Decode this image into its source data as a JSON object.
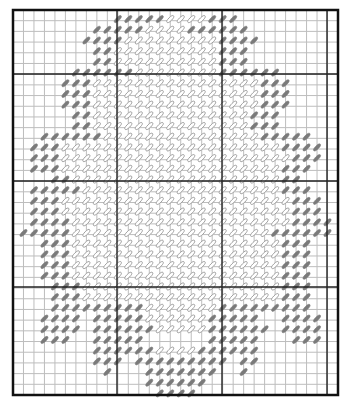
{
  "chart": {
    "type": "needlepoint-stitch-chart",
    "grid": {
      "left": 13,
      "top": 10,
      "right": 338,
      "bottom": 395,
      "cols": 31,
      "rows": 36,
      "major_v": [
        117,
        222,
        327
      ],
      "major_h": [
        74,
        181,
        287
      ],
      "colors": {
        "minor": "#bdbdbd",
        "major": "#222222",
        "border": "#111111",
        "background": "#ffffff"
      }
    },
    "stitch_colors": {
      "dark": "#7a7a7a",
      "light_fill": "#ffffff",
      "light_stroke": "#9a9a9a"
    },
    "legend": "dark = border stitches (gray), light = fill stitches (outlined)",
    "rows": [
      {
        "r": 1,
        "from": 10,
        "to": 21,
        "dark": [
          [
            10,
            14
          ],
          [
            19,
            21
          ]
        ]
      },
      {
        "r": 2,
        "from": 8,
        "to": 22,
        "dark": [
          [
            8,
            12
          ],
          [
            17,
            22
          ]
        ]
      },
      {
        "r": 3,
        "from": 7,
        "to": 23,
        "dark": [
          [
            7,
            10
          ],
          [
            20,
            23
          ]
        ]
      },
      {
        "r": 4,
        "from": 8,
        "to": 22,
        "dark": [
          [
            8,
            9
          ],
          [
            20,
            22
          ]
        ]
      },
      {
        "r": 5,
        "from": 8,
        "to": 22,
        "dark": [
          [
            8,
            9
          ],
          [
            20,
            22
          ]
        ]
      },
      {
        "r": 6,
        "from": 6,
        "to": 25,
        "dark": [
          [
            6,
            11
          ],
          [
            20,
            25
          ]
        ]
      },
      {
        "r": 7,
        "from": 5,
        "to": 26,
        "dark": [
          [
            5,
            7
          ],
          [
            24,
            26
          ]
        ]
      },
      {
        "r": 8,
        "from": 5,
        "to": 26,
        "dark": [
          [
            5,
            7
          ],
          [
            24,
            26
          ]
        ]
      },
      {
        "r": 9,
        "from": 5,
        "to": 26,
        "dark": [
          [
            5,
            7
          ],
          [
            24,
            26
          ]
        ]
      },
      {
        "r": 10,
        "from": 6,
        "to": 25,
        "dark": [
          [
            6,
            7
          ],
          [
            23,
            25
          ]
        ]
      },
      {
        "r": 11,
        "from": 6,
        "to": 25,
        "dark": [
          [
            6,
            7
          ],
          [
            23,
            25
          ]
        ]
      },
      {
        "r": 12,
        "from": 3,
        "to": 28,
        "dark": [
          [
            3,
            8
          ],
          [
            24,
            28
          ]
        ]
      },
      {
        "r": 13,
        "from": 2,
        "to": 29,
        "dark": [
          [
            2,
            4
          ],
          [
            26,
            29
          ]
        ]
      },
      {
        "r": 14,
        "from": 2,
        "to": 29,
        "dark": [
          [
            2,
            4
          ],
          [
            27,
            29
          ]
        ]
      },
      {
        "r": 15,
        "from": 2,
        "to": 28,
        "dark": [
          [
            2,
            4
          ],
          [
            26,
            28
          ]
        ]
      },
      {
        "r": 16,
        "from": 4,
        "to": 27,
        "dark": [
          [
            4,
            5
          ],
          [
            26,
            27
          ]
        ]
      },
      {
        "r": 17,
        "from": 2,
        "to": 28,
        "dark": [
          [
            2,
            6
          ],
          [
            26,
            28
          ]
        ]
      },
      {
        "r": 18,
        "from": 2,
        "to": 29,
        "dark": [
          [
            2,
            4
          ],
          [
            27,
            29
          ]
        ]
      },
      {
        "r": 19,
        "from": 2,
        "to": 29,
        "dark": [
          [
            2,
            4
          ],
          [
            27,
            29
          ]
        ]
      },
      {
        "r": 20,
        "from": 2,
        "to": 30,
        "dark": [
          [
            2,
            5
          ],
          [
            27,
            30
          ]
        ]
      },
      {
        "r": 21,
        "from": 1,
        "to": 30,
        "dark": [
          [
            1,
            5
          ],
          [
            25,
            30
          ]
        ]
      },
      {
        "r": 22,
        "from": 3,
        "to": 28,
        "dark": [
          [
            3,
            5
          ],
          [
            26,
            28
          ]
        ]
      },
      {
        "r": 23,
        "from": 3,
        "to": 28,
        "dark": [
          [
            3,
            5
          ],
          [
            26,
            28
          ]
        ]
      },
      {
        "r": 24,
        "from": 3,
        "to": 28,
        "dark": [
          [
            3,
            5
          ],
          [
            26,
            28
          ]
        ]
      },
      {
        "r": 25,
        "from": 3,
        "to": 28,
        "dark": [
          [
            3,
            5
          ],
          [
            26,
            28
          ]
        ]
      },
      {
        "r": 26,
        "from": 4,
        "to": 28,
        "dark": [
          [
            4,
            6
          ],
          [
            26,
            28
          ]
        ]
      },
      {
        "r": 27,
        "from": 4,
        "to": 28,
        "dark": [
          [
            4,
            6
          ],
          [
            26,
            28
          ]
        ]
      },
      {
        "r": 28,
        "from": 4,
        "to": 28,
        "dark": [
          [
            4,
            12
          ],
          [
            20,
            28
          ]
        ]
      },
      {
        "r": 29,
        "from": 3,
        "to": 29,
        "dark": [
          [
            3,
            6
          ],
          [
            8,
            12
          ],
          [
            19,
            23
          ],
          [
            26,
            29
          ]
        ]
      },
      {
        "r": 30,
        "from": 3,
        "to": 29,
        "dark": [
          [
            3,
            6
          ],
          [
            8,
            13
          ],
          [
            19,
            24
          ],
          [
            26,
            29
          ]
        ]
      },
      {
        "r": 31,
        "from": 3,
        "to": 29,
        "dark": [
          [
            3,
            5
          ],
          [
            8,
            12
          ],
          [
            19,
            23
          ],
          [
            27,
            29
          ]
        ]
      },
      {
        "r": 32,
        "from": 8,
        "to": 23,
        "dark": [
          [
            8,
            13
          ],
          [
            18,
            23
          ]
        ]
      },
      {
        "r": 33,
        "from": 8,
        "to": 23,
        "dark": [
          [
            8,
            10
          ],
          [
            12,
            20
          ],
          [
            22,
            23
          ]
        ]
      },
      {
        "r": 34,
        "from": 9,
        "to": 22,
        "dark": [
          [
            9,
            9
          ],
          [
            13,
            19
          ],
          [
            22,
            22
          ]
        ]
      },
      {
        "r": 35,
        "from": 13,
        "to": 18,
        "dark": [
          [
            13,
            18
          ]
        ]
      },
      {
        "r": 36,
        "from": 14,
        "to": 17,
        "dark": [
          [
            14,
            17
          ]
        ]
      }
    ],
    "gaps": [
      {
        "r": 29,
        "cols": [
          7,
          24,
          25
        ]
      },
      {
        "r": 30,
        "cols": [
          7,
          25
        ]
      },
      {
        "r": 31,
        "cols": [
          6,
          7,
          13,
          14,
          15,
          16,
          17,
          18,
          24,
          25,
          26
        ]
      },
      {
        "r": 32,
        "cols": []
      },
      {
        "r": 33,
        "cols": [
          11,
          21
        ]
      },
      {
        "r": 34,
        "cols": [
          10,
          11,
          12,
          20,
          21
        ]
      }
    ]
  }
}
